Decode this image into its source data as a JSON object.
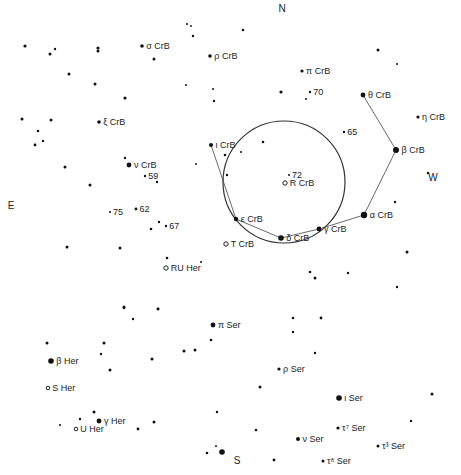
{
  "chart": {
    "background": "#ffffff",
    "ink": "#111111",
    "directions": [
      {
        "id": "north",
        "label": "N",
        "x": 282,
        "y": 12
      },
      {
        "id": "south",
        "label": "S",
        "x": 237,
        "y": 464
      },
      {
        "id": "east",
        "label": "E",
        "x": 11,
        "y": 209
      },
      {
        "id": "west",
        "label": "W",
        "x": 433,
        "y": 181
      }
    ],
    "field_circle": {
      "cx": 284,
      "cy": 182,
      "r": 61
    },
    "named_stars": [
      {
        "id": "sigma-crb",
        "label": "σ CrB",
        "x": 142,
        "y": 46,
        "r": 1.8,
        "variable": false
      },
      {
        "id": "rho-crb",
        "label": "ρ CrB",
        "x": 210,
        "y": 56,
        "r": 1.8,
        "variable": false
      },
      {
        "id": "pi-crb",
        "label": "π CrB",
        "x": 302,
        "y": 71,
        "r": 1.6,
        "variable": false
      },
      {
        "id": "theta-crb",
        "label": "θ CrB",
        "x": 363,
        "y": 95,
        "r": 2.4,
        "variable": false
      },
      {
        "id": "eta-crb",
        "label": "η CrB",
        "x": 418,
        "y": 117,
        "r": 1.6,
        "variable": false
      },
      {
        "id": "xi-crb",
        "label": "ξ CrB",
        "x": 99,
        "y": 122,
        "r": 1.8,
        "variable": false
      },
      {
        "id": "iota-crb",
        "label": "ι CrB",
        "x": 211,
        "y": 145,
        "r": 2.0,
        "variable": false
      },
      {
        "id": "beta-crb",
        "label": "β CrB",
        "x": 396,
        "y": 150,
        "r": 3.0,
        "variable": false
      },
      {
        "id": "nu-crb",
        "label": "ν CrB",
        "x": 129,
        "y": 165,
        "r": 2.4,
        "variable": false
      },
      {
        "id": "epsilon-crb",
        "label": "ε CrB",
        "x": 236,
        "y": 219,
        "r": 2.2,
        "variable": false
      },
      {
        "id": "alpha-crb",
        "label": "α CrB",
        "x": 364,
        "y": 215,
        "r": 3.2,
        "variable": false
      },
      {
        "id": "gamma-crb",
        "label": "γ CrB",
        "x": 319,
        "y": 229,
        "r": 2.4,
        "variable": false
      },
      {
        "id": "delta-crb",
        "label": "δ CrB",
        "x": 281,
        "y": 238,
        "r": 2.8,
        "variable": false
      },
      {
        "id": "r-crb",
        "label": "R CrB",
        "x": 285,
        "y": 183,
        "r": 2.2,
        "variable": true
      },
      {
        "id": "t-crb",
        "label": "T CrB",
        "x": 226,
        "y": 244,
        "r": 2.2,
        "variable": true
      },
      {
        "id": "ru-her",
        "label": "RU Her",
        "x": 166,
        "y": 268,
        "r": 2.2,
        "variable": true
      },
      {
        "id": "pi-ser",
        "label": "π Ser",
        "x": 213,
        "y": 325,
        "r": 2.4,
        "variable": false
      },
      {
        "id": "beta-her",
        "label": "β Her",
        "x": 51,
        "y": 361,
        "r": 2.8,
        "variable": false
      },
      {
        "id": "rho-ser",
        "label": "ρ Ser",
        "x": 279,
        "y": 369,
        "r": 1.6,
        "variable": false
      },
      {
        "id": "s-her",
        "label": "S Her",
        "x": 48,
        "y": 388,
        "r": 1.8,
        "variable": true
      },
      {
        "id": "iota-ser",
        "label": "ι Ser",
        "x": 339,
        "y": 398,
        "r": 2.8,
        "variable": false
      },
      {
        "id": "gamma-her",
        "label": "γ Her",
        "x": 99,
        "y": 421,
        "r": 2.4,
        "variable": false
      },
      {
        "id": "tau7-ser",
        "label": "τ⁷ Ser",
        "x": 338,
        "y": 428,
        "r": 1.6,
        "variable": false
      },
      {
        "id": "u-her",
        "label": "U Her",
        "x": 76,
        "y": 429,
        "r": 1.8,
        "variable": true
      },
      {
        "id": "nu-ser",
        "label": "ν Ser",
        "x": 298,
        "y": 439,
        "r": 2.0,
        "variable": false
      },
      {
        "id": "tau3-ser",
        "label": "τ³ Ser",
        "x": 378,
        "y": 446,
        "r": 1.5,
        "variable": false
      },
      {
        "id": "tau8-ser",
        "label": "τ⁸ Ser",
        "x": 323,
        "y": 461,
        "r": 1.5,
        "variable": false
      }
    ],
    "numbered_stars": [
      {
        "id": "star-70",
        "label": "70",
        "x": 310,
        "y": 92,
        "r": 1.2
      },
      {
        "id": "star-65",
        "label": "65",
        "x": 344,
        "y": 132,
        "r": 1.2
      },
      {
        "id": "star-72",
        "label": "72",
        "x": 289,
        "y": 175,
        "r": 1.0
      },
      {
        "id": "star-59",
        "label": "59",
        "x": 145,
        "y": 176,
        "r": 1.2
      },
      {
        "id": "star-75",
        "label": "75",
        "x": 110,
        "y": 212,
        "r": 1.0
      },
      {
        "id": "star-62",
        "label": "62",
        "x": 136,
        "y": 209,
        "r": 1.4
      },
      {
        "id": "star-67",
        "label": "67",
        "x": 166,
        "y": 226,
        "r": 1.2
      }
    ],
    "asterism_lines": [
      {
        "from": "theta-crb",
        "to": "beta-crb"
      },
      {
        "from": "beta-crb",
        "to": "alpha-crb"
      },
      {
        "from": "alpha-crb",
        "to": "gamma-crb"
      },
      {
        "from": "gamma-crb",
        "to": "delta-crb"
      },
      {
        "from": "delta-crb",
        "to": "epsilon-crb"
      },
      {
        "from": "epsilon-crb",
        "to": "iota-crb"
      }
    ],
    "field_stars": [
      [
        25,
        46,
        1.6
      ],
      [
        50,
        54,
        1.5
      ],
      [
        55,
        49,
        1.2
      ],
      [
        98,
        48,
        1.6
      ],
      [
        98,
        51,
        1.5
      ],
      [
        69,
        74,
        1.5
      ],
      [
        95,
        84,
        1.5
      ],
      [
        125,
        98,
        1.6
      ],
      [
        154,
        59,
        1.5
      ],
      [
        187,
        24,
        1.0
      ],
      [
        191,
        26,
        0.9
      ],
      [
        193,
        36,
        1.2
      ],
      [
        186,
        85,
        1.0
      ],
      [
        213,
        89,
        1.0
      ],
      [
        214,
        101,
        1.2
      ],
      [
        243,
        30,
        1.3
      ],
      [
        281,
        92,
        1.6
      ],
      [
        306,
        99,
        1.0
      ],
      [
        378,
        50,
        1.5
      ],
      [
        397,
        64,
        1.0
      ],
      [
        22,
        119,
        1.5
      ],
      [
        51,
        120,
        1.5
      ],
      [
        38,
        131,
        1.3
      ],
      [
        43,
        141,
        1.2
      ],
      [
        35,
        145,
        1.4
      ],
      [
        125,
        158,
        1.2
      ],
      [
        65,
        167,
        1.5
      ],
      [
        90,
        185,
        1.5
      ],
      [
        157,
        182,
        1.2
      ],
      [
        196,
        164,
        1.0
      ],
      [
        225,
        155,
        1.3
      ],
      [
        241,
        152,
        1.0
      ],
      [
        263,
        142,
        1.3
      ],
      [
        227,
        175,
        1.2
      ],
      [
        395,
        202,
        1.2
      ],
      [
        428,
        173,
        1.2
      ],
      [
        67,
        247,
        1.5
      ],
      [
        120,
        248,
        1.5
      ],
      [
        151,
        229,
        1.3
      ],
      [
        159,
        222,
        1.2
      ],
      [
        167,
        258,
        1.3
      ],
      [
        201,
        262,
        1.0
      ],
      [
        407,
        252,
        1.5
      ],
      [
        310,
        272,
        1.3
      ],
      [
        315,
        278,
        1.5
      ],
      [
        348,
        273,
        1.2
      ],
      [
        397,
        287,
        1.2
      ],
      [
        124,
        307,
        1.5
      ],
      [
        158,
        309,
        1.3
      ],
      [
        321,
        318,
        1.4
      ],
      [
        133,
        319,
        1.2
      ],
      [
        158,
        309,
        1.4
      ],
      [
        124,
        308,
        1.3
      ],
      [
        211,
        340,
        1.3
      ],
      [
        184,
        351,
        1.5
      ],
      [
        195,
        350,
        1.5
      ],
      [
        152,
        359,
        1.5
      ],
      [
        104,
        343,
        1.5
      ],
      [
        101,
        354,
        1.2
      ],
      [
        110,
        370,
        1.5
      ],
      [
        47,
        343,
        1.5
      ],
      [
        293,
        318,
        1.3
      ],
      [
        293,
        332,
        1.2
      ],
      [
        315,
        353,
        1.2
      ],
      [
        260,
        387,
        1.5
      ],
      [
        432,
        394,
        1.5
      ],
      [
        411,
        421,
        1.2
      ],
      [
        256,
        430,
        1.3
      ],
      [
        217,
        412,
        1.2
      ],
      [
        207,
        453,
        1.3
      ],
      [
        216,
        446,
        1.0
      ],
      [
        222,
        452,
        2.8
      ],
      [
        274,
        460,
        1.4
      ],
      [
        94,
        412,
        1.5
      ],
      [
        80,
        419,
        1.2
      ],
      [
        60,
        425,
        1.0
      ],
      [
        154,
        422,
        1.5
      ],
      [
        138,
        429,
        1.4
      ]
    ]
  }
}
